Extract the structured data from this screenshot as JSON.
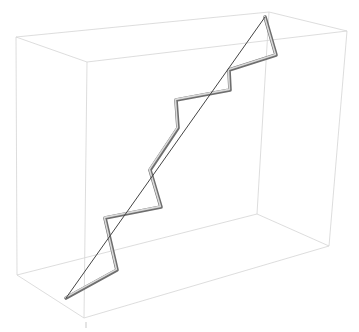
{
  "chart_data": {
    "type": "line",
    "title": "",
    "box": {
      "edge_color": "#d4d4d4",
      "top": [
        [
          16,
          37
        ],
        [
          269,
          12
        ],
        [
          347,
          31
        ],
        [
          87,
          62
        ]
      ],
      "bottom": [
        [
          17,
          275
        ],
        [
          257,
          214
        ],
        [
          329,
          246
        ],
        [
          84,
          318
        ]
      ]
    },
    "tube_path": {
      "color": "#9a9a9a",
      "points": [
        [
          66,
          298
        ],
        [
          117,
          270
        ],
        [
          105,
          218
        ],
        [
          161,
          207
        ],
        [
          150,
          170
        ],
        [
          178,
          128
        ],
        [
          176,
          100
        ],
        [
          230,
          90
        ],
        [
          229,
          70
        ],
        [
          276,
          55
        ],
        [
          265,
          17
        ]
      ]
    },
    "straight_line": {
      "color": "#444444",
      "from": [
        66,
        298
      ],
      "to": [
        265,
        17
      ]
    },
    "tick": {
      "from": [
        86,
        322
      ],
      "to": [
        86,
        328
      ]
    }
  }
}
